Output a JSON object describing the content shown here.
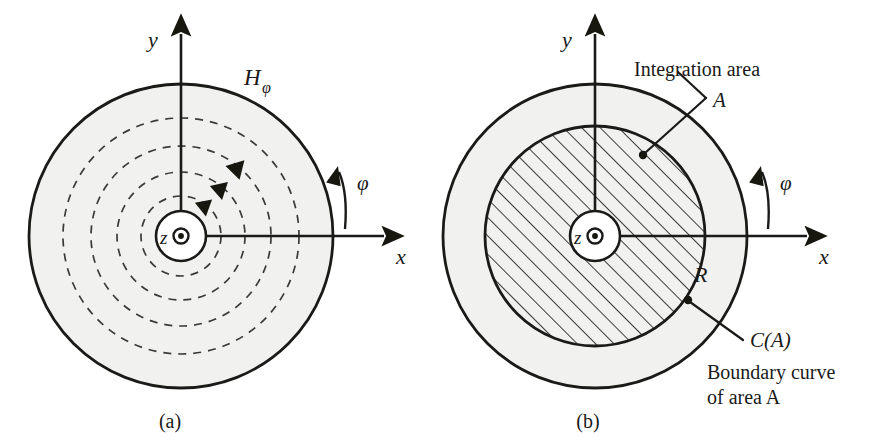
{
  "figure": {
    "background_color": "#ffffff",
    "ink_color": "#1a1a18",
    "shade_color": "#f1f1ef"
  },
  "panels": [
    {
      "id": "a",
      "caption": "(a)",
      "axes": {
        "y_label": "y",
        "x_label": "x",
        "z_label": "z",
        "z_symbol": "dot-in-circle-out-of-page"
      },
      "labels": {
        "field_symbol": "H",
        "field_subscript": "φ",
        "angle_label": "φ"
      },
      "field_lines": {
        "count": 4,
        "style": "dashed",
        "direction": "counterclockwise",
        "arrow_count": 3,
        "radii_px": [
          40,
          64,
          90,
          118
        ]
      },
      "geometry": {
        "center_px": [
          181,
          236
        ],
        "outer_radius_px": 152,
        "conductor_radius_px": 25
      }
    },
    {
      "id": "b",
      "caption": "(b)",
      "axes": {
        "y_label": "y",
        "x_label": "x",
        "z_label": "z",
        "z_symbol": "dot-in-circle-out-of-page"
      },
      "labels": {
        "angle_label": "φ",
        "radius_label": "R",
        "integration_area_title": "Integration area",
        "integration_area_symbol": "A",
        "boundary_symbol": "C(A)",
        "boundary_text_line1": "Boundary curve",
        "boundary_text_line2": "of area A"
      },
      "geometry": {
        "center_px": [
          160,
          236
        ],
        "outer_radius_px": 152,
        "integration_radius_px": 110,
        "conductor_radius_px": 25,
        "hatch_angle_deg": 45
      }
    }
  ]
}
